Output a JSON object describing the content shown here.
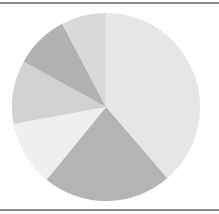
{
  "chart_data": {
    "type": "pie",
    "title": "",
    "legend": [],
    "center": [
      106,
      107
    ],
    "radius": 94,
    "start_angle_deg": 90,
    "direction": "clockwise",
    "slices": [
      {
        "label": "",
        "value": 38.7,
        "color": "#e6e6e6"
      },
      {
        "label": "",
        "value": 22.2,
        "color": "#b4b4b4"
      },
      {
        "label": "",
        "value": 11.2,
        "color": "#efefef"
      },
      {
        "label": "",
        "value": 10.9,
        "color": "#d2d2d2"
      },
      {
        "label": "",
        "value": 9.3,
        "color": "#b2b2b2"
      },
      {
        "label": "",
        "value": 7.7,
        "color": "#d9d9d9"
      }
    ],
    "values": [
      38.7,
      22.2,
      11.2,
      10.9,
      9.3,
      7.7
    ]
  },
  "frame": {
    "rule_color": "#8c8c8c"
  }
}
